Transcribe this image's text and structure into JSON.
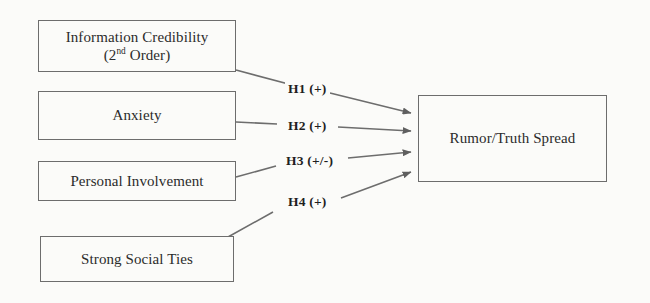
{
  "diagram": {
    "background_color": "#fbfbf9",
    "line_color": "#6d6d6d",
    "text_color": "#2b2b2b",
    "nodes": [
      {
        "id": "information-credibility",
        "line1": "Information Credibility",
        "line2_prefix": "(2",
        "line2_sup": "nd",
        "line2_suffix": " Order)"
      },
      {
        "id": "anxiety",
        "label": "Anxiety"
      },
      {
        "id": "personal-involvement",
        "label": "Personal Involvement"
      },
      {
        "id": "strong-social-ties",
        "label": "Strong Social Ties"
      },
      {
        "id": "rumor-truth-spread",
        "label": "Rumor/Truth Spread"
      }
    ],
    "edges": [
      {
        "id": "h1",
        "label": "H1 (+)",
        "from": "information-credibility",
        "to": "rumor-truth-spread",
        "sign": "+"
      },
      {
        "id": "h2",
        "label": "H2 (+)",
        "from": "anxiety",
        "to": "rumor-truth-spread",
        "sign": "+"
      },
      {
        "id": "h3",
        "label": "H3 (+/-)",
        "from": "personal-involvement",
        "to": "rumor-truth-spread",
        "sign": "+/-"
      },
      {
        "id": "h4",
        "label": "H4 (+)",
        "from": "strong-social-ties",
        "to": "rumor-truth-spread",
        "sign": "+"
      }
    ]
  }
}
